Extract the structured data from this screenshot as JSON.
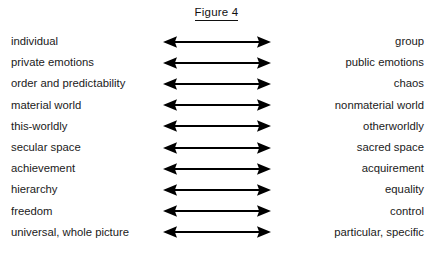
{
  "figure": {
    "title": "Figure 4",
    "title_underlined": true,
    "background_color": "#ffffff",
    "text_color": "#1a1a1a",
    "arrow_color": "#000000",
    "arrow_icon_name": "double-headed-arrow-icon",
    "rows": [
      {
        "left": "individual",
        "right": "group"
      },
      {
        "left": "private emotions",
        "right": "public emotions"
      },
      {
        "left": "order and predictability",
        "right": "chaos"
      },
      {
        "left": "material world",
        "right": "nonmaterial world"
      },
      {
        "left": "this-worldly",
        "right": "otherworldly"
      },
      {
        "left": "secular space",
        "right": "sacred space"
      },
      {
        "left": "achievement",
        "right": "acquirement"
      },
      {
        "left": "hierarchy",
        "right": "equality"
      },
      {
        "left": "freedom",
        "right": "control"
      },
      {
        "left": "universal, whole picture",
        "right": "particular, specific"
      }
    ]
  }
}
